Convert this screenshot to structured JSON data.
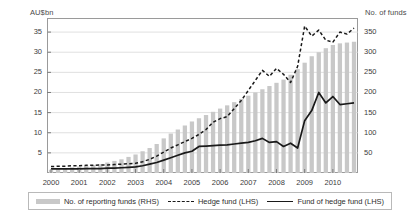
{
  "chart_data": {
    "type": "bar",
    "title": "",
    "subtitle": "",
    "ylabel": "AU$bn",
    "ylabel_right": "No. of funds",
    "xlabel": "",
    "ylim": [
      0,
      38.5
    ],
    "ylim_right": [
      0,
      385
    ],
    "ytick_labels": [
      "5",
      "10",
      "15",
      "20",
      "25",
      "30",
      "35"
    ],
    "ytick_values": [
      5,
      10,
      15,
      20,
      25,
      30,
      35
    ],
    "ytick_right_labels": [
      "50",
      "100",
      "150",
      "200",
      "250",
      "300",
      "350"
    ],
    "ytick_right_values": [
      50,
      100,
      150,
      200,
      250,
      300,
      350
    ],
    "xtick_labels": [
      "2000",
      "2001",
      "2002",
      "2003",
      "2004",
      "2005",
      "2006",
      "2007",
      "2008",
      "2009",
      "2010"
    ],
    "grid": true,
    "legend_position": "below-plot",
    "colors": {
      "bars": "#c8c8c8",
      "hedge_fund_line": "#1a1a1a",
      "fund_of_hedge_fund_line": "#1a1a1a",
      "grid": "#d8d8d8",
      "frame": "#9a9a9a",
      "text": "#3c3c3c"
    },
    "legend": [
      {
        "label": "No. of reporting funds (RHS)",
        "marker": "bar-swatch",
        "axis": "right"
      },
      {
        "label": "Hedge fund (LHS)",
        "marker": "dashed-line",
        "axis": "left"
      },
      {
        "label": "Fund of hedge fund (LHS)",
        "marker": "solid-line",
        "axis": "left"
      }
    ],
    "x": [
      2000.0,
      2000.25,
      2000.5,
      2000.75,
      2001.0,
      2001.25,
      2001.5,
      2001.75,
      2002.0,
      2002.25,
      2002.5,
      2002.75,
      2003.0,
      2003.25,
      2003.5,
      2003.75,
      2004.0,
      2004.25,
      2004.5,
      2004.75,
      2005.0,
      2005.25,
      2005.5,
      2005.75,
      2006.0,
      2006.25,
      2006.5,
      2006.75,
      2007.0,
      2007.25,
      2007.5,
      2007.75,
      2008.0,
      2008.25,
      2008.5,
      2008.75,
      2009.0,
      2009.25,
      2009.5,
      2009.75,
      2010.0,
      2010.25,
      2010.5,
      2010.75
    ],
    "series": [
      {
        "name": "No. of reporting funds (RHS)",
        "type": "bar",
        "axis": "right",
        "unit": "No. of funds",
        "values": [
          8,
          10,
          12,
          14,
          16,
          18,
          20,
          22,
          26,
          30,
          34,
          40,
          46,
          54,
          62,
          72,
          86,
          98,
          108,
          118,
          128,
          136,
          144,
          152,
          160,
          168,
          176,
          184,
          192,
          200,
          208,
          216,
          224,
          232,
          244,
          258,
          274,
          290,
          300,
          310,
          318,
          322,
          324,
          326
        ]
      },
      {
        "name": "Hedge fund (LHS)",
        "type": "line",
        "style": "dashed",
        "axis": "left",
        "unit": "AU$bn",
        "values": [
          1.6,
          1.7,
          1.7,
          1.8,
          1.8,
          1.9,
          1.9,
          2.0,
          2.0,
          2.1,
          2.2,
          2.3,
          2.4,
          2.8,
          3.4,
          4.2,
          5.2,
          6.2,
          7.0,
          7.8,
          8.6,
          9.6,
          10.8,
          12.6,
          13.5,
          14.0,
          16.0,
          18.0,
          20.5,
          23.0,
          25.5,
          24.0,
          26.0,
          24.5,
          22.5,
          26.5,
          36.5,
          34.0,
          35.5,
          33.0,
          32.5,
          35.0,
          34.5,
          36.0
        ]
      },
      {
        "name": "Fund of hedge fund (LHS)",
        "type": "line",
        "style": "solid",
        "axis": "left",
        "unit": "AU$bn",
        "values": [
          1.0,
          1.0,
          1.0,
          1.0,
          1.0,
          1.1,
          1.1,
          1.1,
          1.2,
          1.2,
          1.3,
          1.4,
          1.5,
          1.8,
          2.2,
          2.6,
          3.2,
          3.8,
          4.4,
          5.0,
          5.4,
          6.6,
          6.7,
          6.8,
          6.9,
          7.0,
          7.2,
          7.4,
          7.6,
          8.0,
          8.6,
          7.6,
          7.8,
          6.6,
          7.4,
          6.2,
          13.0,
          15.5,
          20.0,
          17.4,
          19.0,
          17.0,
          17.2,
          17.4
        ]
      }
    ]
  }
}
